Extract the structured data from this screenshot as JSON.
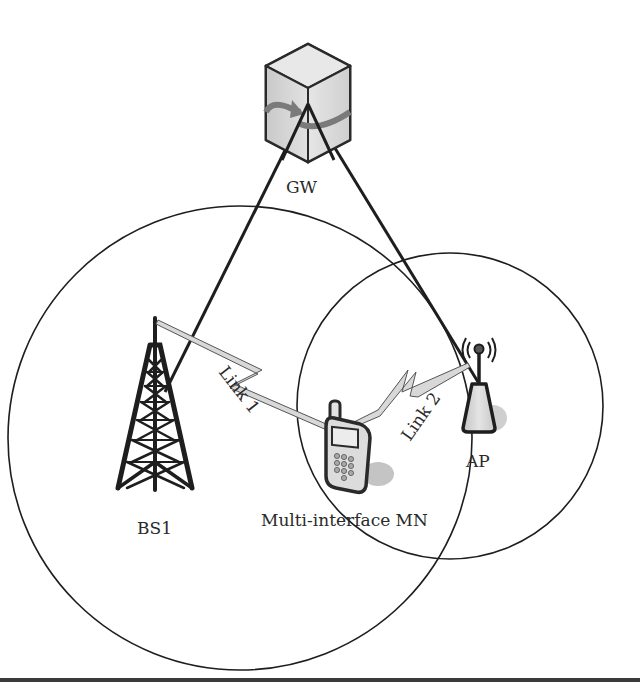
{
  "diagram": {
    "nodes": {
      "gateway": {
        "label": "GW",
        "icon": "server-cube-icon"
      },
      "base_station": {
        "label": "BS1",
        "icon": "cell-tower-icon"
      },
      "access_point": {
        "label": "AP",
        "icon": "wireless-access-point-icon"
      },
      "mobile_node": {
        "label": "Multi-interface MN",
        "icon": "mobile-phone-icon"
      }
    },
    "links": [
      {
        "label": "Link 1",
        "from": "BS1",
        "to": "Multi-interface MN",
        "type": "wireless"
      },
      {
        "label": "Link 2",
        "from": "AP",
        "to": "Multi-interface MN",
        "type": "wireless"
      }
    ],
    "wired_connections": [
      {
        "from": "GW",
        "to": "BS1"
      },
      {
        "from": "GW",
        "to": "AP"
      }
    ],
    "coverage_areas": [
      {
        "name": "BS1 coverage",
        "shape": "circle"
      },
      {
        "name": "AP coverage",
        "shape": "circle"
      }
    ],
    "colors": {
      "stroke": "#1e1e1e",
      "fill_light": "#d8d8d8",
      "fill_shadow": "#bdbdbd",
      "arrow": "#7a7a7a",
      "background": "#ffffff"
    }
  }
}
